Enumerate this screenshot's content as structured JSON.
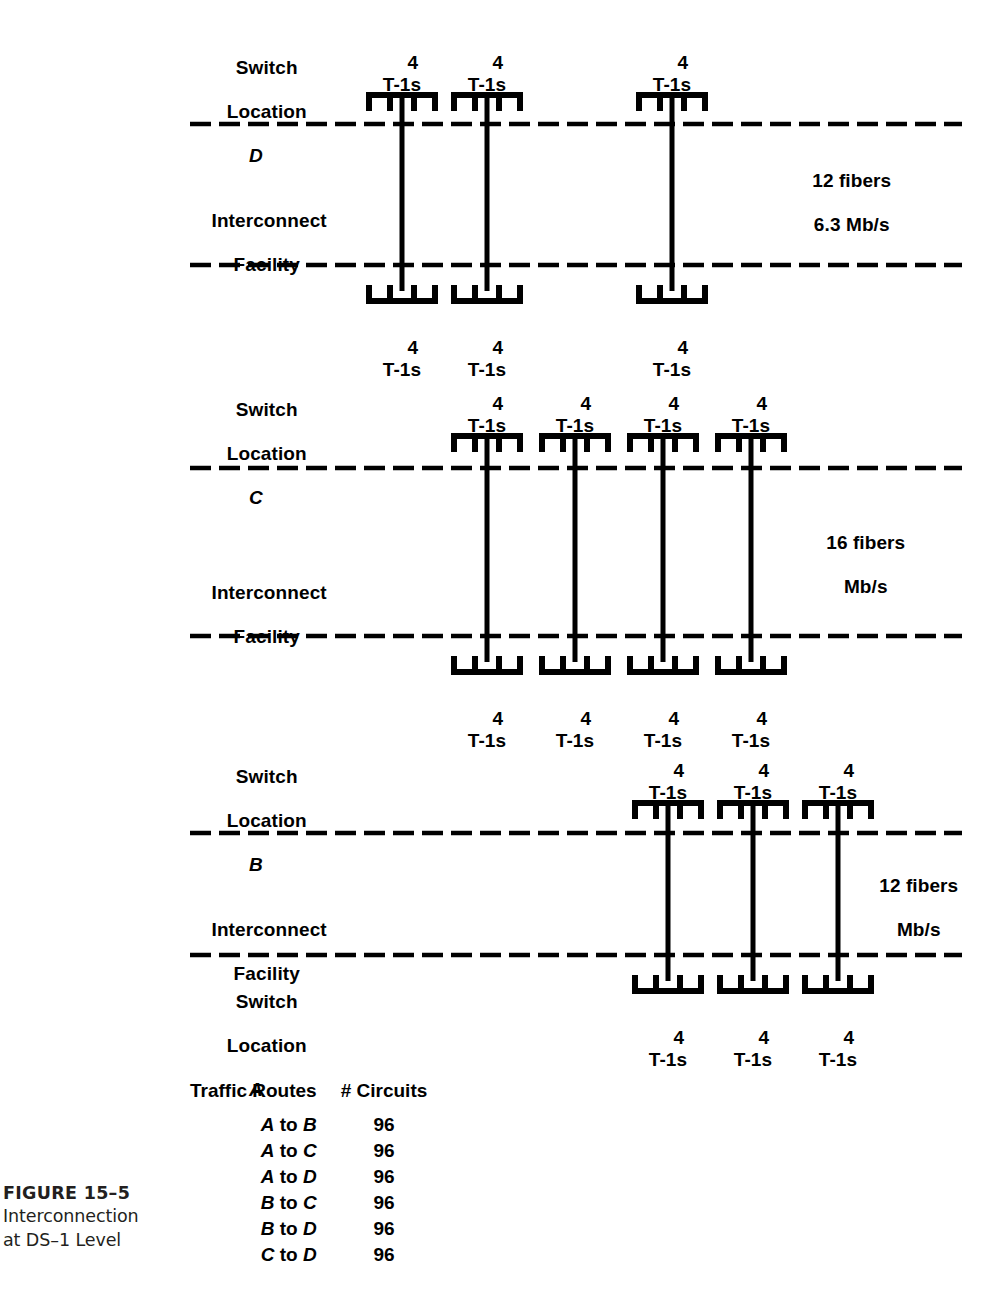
{
  "figure": {
    "number": "FIGURE 15–5",
    "description_line1": "Interconnection",
    "description_line2": "at DS–1 Level"
  },
  "mux": {
    "count_label": "4",
    "unit_label": "T-1s"
  },
  "sections": [
    {
      "id": "D",
      "switch_line1": "Switch",
      "switch_line2": "Location",
      "switch_letter": "D",
      "facility_line1": "Interconnect",
      "facility_line2": "Facility",
      "fiber_line1": "12 fibers",
      "fiber_line2": "6.3 Mb/s",
      "trunk_count": 3
    },
    {
      "id": "C",
      "switch_line1": "Switch",
      "switch_line2": "Location",
      "switch_letter": "C",
      "facility_line1": "Interconnect",
      "facility_line2": "Facility",
      "fiber_line1": "16 fibers",
      "fiber_line2": "Mb/s",
      "trunk_count": 4
    },
    {
      "id": "B",
      "switch_line1": "Switch",
      "switch_line2": "Location",
      "switch_letter": "B",
      "facility_line1": "Interconnect",
      "facility_line2": "Facility",
      "fiber_line1": "12 fibers",
      "fiber_line2": "Mb/s",
      "trunk_count": 3
    },
    {
      "id": "A",
      "switch_line1": "Switch",
      "switch_line2": "Location",
      "switch_letter": "A",
      "trunk_count": 3
    }
  ],
  "traffic_table": {
    "header_routes": "Traffic Routes",
    "header_circuits": "# Circuits",
    "rows": [
      {
        "from": "A",
        "to": "B",
        "circuits": "96"
      },
      {
        "from": "A",
        "to": "C",
        "circuits": "96"
      },
      {
        "from": "A",
        "to": "D",
        "circuits": "96"
      },
      {
        "from": "B",
        "to": "C",
        "circuits": "96"
      },
      {
        "from": "B",
        "to": "D",
        "circuits": "96"
      },
      {
        "from": "C",
        "to": "D",
        "circuits": "96"
      }
    ],
    "connector_word": "to"
  },
  "colors": {
    "ink": "#000000",
    "caption_ink": "#231f20",
    "background": "#ffffff"
  }
}
